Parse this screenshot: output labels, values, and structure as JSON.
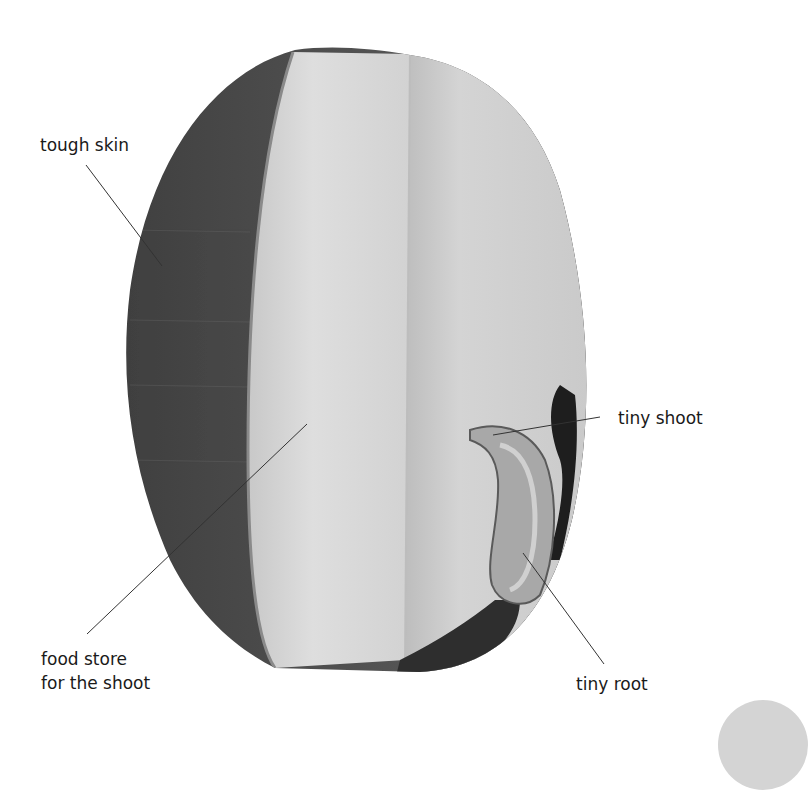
{
  "figure": {
    "colors": {
      "background": "#ffffff",
      "skin": "#4a4a4a",
      "skin_edge": "#6a6a6a",
      "food_store_left": "#d6d6d6",
      "food_store_right": "#cfcfcf",
      "split_line": "#bdbdbd",
      "embryo": "#b8b8b8",
      "dark_base": "#2e2e2e",
      "leader_line": "#333333",
      "label_text": "#1a1a1a"
    },
    "labels": {
      "tough_skin": "tough skin",
      "food_store_line1": "food store",
      "food_store_line2": "for the shoot",
      "tiny_shoot": "tiny shoot",
      "tiny_root": "tiny root"
    }
  }
}
